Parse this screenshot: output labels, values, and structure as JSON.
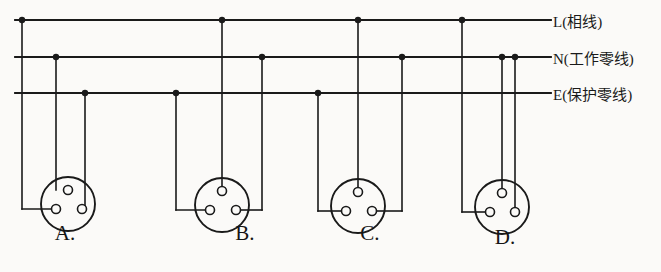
{
  "figure": {
    "background_color": "#fbfaf8",
    "line_color": "#1a1a1a"
  },
  "bus_lines": [
    {
      "id": "L",
      "label": "L(相线)",
      "name": "live-phase-line",
      "y": 20,
      "x_start": 15,
      "x_end": 551
    },
    {
      "id": "N",
      "label": "N(工作零线)",
      "name": "neutral-working-line",
      "y": 57,
      "x_start": 15,
      "x_end": 551
    },
    {
      "id": "E",
      "label": "E(保护零线)",
      "name": "protective-earth-line",
      "y": 93,
      "x_start": 15,
      "x_end": 551
    }
  ],
  "bus_label_x": 553,
  "options": [
    {
      "key": "A",
      "label": "A.",
      "label_x": 65,
      "label_y": 246,
      "circle": {
        "cx": 68,
        "cy": 204,
        "r": 27
      },
      "holes": [
        {
          "name": "top-hole",
          "cx": 68,
          "cy": 190,
          "r": 4.5
        },
        {
          "name": "bottom-left-hole",
          "cx": 56,
          "cy": 209,
          "r": 4.5
        },
        {
          "name": "bottom-right-hole",
          "cx": 82,
          "cy": 209,
          "r": 4.5
        }
      ],
      "drops": [
        {
          "from_bus": "L",
          "x": 22,
          "junction": true,
          "target_hole": "bottom-left-hole",
          "elbow_y": 209
        },
        {
          "from_bus": "N",
          "x": 56,
          "junction": true,
          "target_hole": "top-hole",
          "elbow_y": null
        },
        {
          "from_bus": "E",
          "x": 85,
          "junction": true,
          "target_hole": "bottom-right-hole",
          "elbow_y": 209
        }
      ]
    },
    {
      "key": "B",
      "label": "B.",
      "label_x": 245,
      "label_y": 246,
      "circle": {
        "cx": 222,
        "cy": 205,
        "r": 27
      },
      "holes": [
        {
          "name": "top-hole",
          "cx": 222,
          "cy": 191,
          "r": 4.5
        },
        {
          "name": "bottom-left-hole",
          "cx": 210,
          "cy": 210,
          "r": 4.5
        },
        {
          "name": "bottom-right-hole",
          "cx": 236,
          "cy": 210,
          "r": 4.5
        }
      ],
      "drops": [
        {
          "from_bus": "E",
          "x": 176,
          "junction": true,
          "target_hole": "bottom-left-hole",
          "elbow_y": 210
        },
        {
          "from_bus": "L",
          "x": 222,
          "junction": true,
          "target_hole": "top-hole",
          "elbow_y": null
        },
        {
          "from_bus": "N",
          "x": 262,
          "junction": true,
          "target_hole": "bottom-right-hole",
          "elbow_y": 210
        }
      ]
    },
    {
      "key": "C",
      "label": "C.",
      "label_x": 370,
      "label_y": 246,
      "circle": {
        "cx": 358,
        "cy": 206,
        "r": 27
      },
      "holes": [
        {
          "name": "top-hole",
          "cx": 358,
          "cy": 192,
          "r": 4.5
        },
        {
          "name": "bottom-left-hole",
          "cx": 346,
          "cy": 211,
          "r": 4.5
        },
        {
          "name": "bottom-right-hole",
          "cx": 372,
          "cy": 211,
          "r": 4.5
        }
      ],
      "drops": [
        {
          "from_bus": "E",
          "x": 318,
          "junction": true,
          "target_hole": "bottom-left-hole",
          "elbow_y": 211
        },
        {
          "from_bus": "L",
          "x": 358,
          "junction": true,
          "target_hole": "top-hole",
          "elbow_y": null
        },
        {
          "from_bus": "N",
          "x": 402,
          "junction": true,
          "target_hole": "bottom-right-hole",
          "elbow_y": 211
        }
      ]
    },
    {
      "key": "D",
      "label": "D.",
      "label_x": 505,
      "label_y": 250,
      "circle": {
        "cx": 502,
        "cy": 207,
        "r": 27
      },
      "holes": [
        {
          "name": "top-hole",
          "cx": 502,
          "cy": 193,
          "r": 4.5
        },
        {
          "name": "bottom-left-hole",
          "cx": 490,
          "cy": 212,
          "r": 4.5
        },
        {
          "name": "bottom-right-hole",
          "cx": 515,
          "cy": 212,
          "r": 4.5
        }
      ],
      "drops": [
        {
          "from_bus": "L",
          "x": 462,
          "junction": true,
          "target_hole": "bottom-left-hole",
          "elbow_y": 212
        },
        {
          "from_bus": "N",
          "x": 502,
          "junction": true,
          "target_hole": "top-hole",
          "elbow_y": null
        },
        {
          "from_bus": "N",
          "x": 515,
          "junction": true,
          "target_hole": "bottom-right-hole",
          "elbow_y": null
        }
      ]
    }
  ]
}
